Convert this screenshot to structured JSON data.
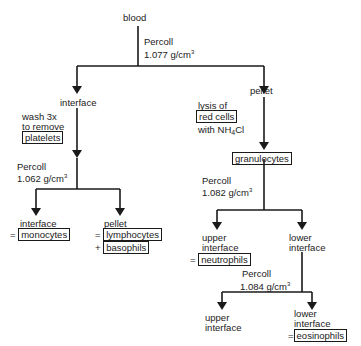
{
  "diagram": {
    "title_node": "blood",
    "step1": {
      "reagent": "Percoll",
      "density": "1.077 g/cm",
      "exp": "3"
    },
    "left_branch": {
      "node": "interface",
      "wash": [
        "wash 3x",
        "to remove"
      ],
      "wash_box": "platelets",
      "step": {
        "reagent": "Percoll",
        "density": "1.062 g/cm",
        "exp": "3"
      },
      "left_child": {
        "label": "interface",
        "prefix": "=",
        "result": "monocytes"
      },
      "right_child": {
        "label": "pellet",
        "prefix1": "=",
        "result1": "lymphocytes",
        "prefix2": "+",
        "result2": "basophils"
      }
    },
    "right_branch": {
      "node": "pellet",
      "lysis_line1": "lysis of",
      "lysis_box": "red cells",
      "lysis_line3_pre": "with NH",
      "lysis_sub": "4",
      "lysis_line3_post": "Cl",
      "granulocytes": "granulocytes",
      "step": {
        "reagent": "Percoll",
        "density": "1.082 g/cm",
        "exp": "3"
      },
      "upper": {
        "line1": "upper",
        "line2": "interface",
        "prefix": "=",
        "result": "neutrophils"
      },
      "lower": {
        "line1": "lower",
        "line2": "interface"
      },
      "step2": {
        "reagent": "Percoll",
        "density": "1.084  g/cm",
        "exp": "3"
      },
      "upper2": {
        "line1": "upper",
        "line2": "interface"
      },
      "lower2": {
        "line1": "lower",
        "line2": "interface",
        "prefix": "=",
        "result": "eosinophils"
      }
    }
  }
}
